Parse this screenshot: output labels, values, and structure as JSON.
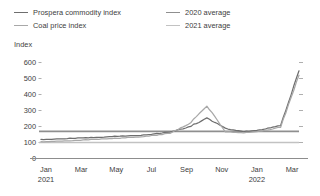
{
  "legend": {
    "items": [
      {
        "label": "Prospera commodity index",
        "color": "#6e6e6e",
        "name": "legend-prospera-commodity-index"
      },
      {
        "label": "Coal price index",
        "color": "#a8a8a8",
        "name": "legend-coal-price-index"
      },
      {
        "label": "2020 average",
        "color": "#8f8f8f",
        "name": "legend-2020-average"
      },
      {
        "label": "2021 average",
        "color": "#c2c2c2",
        "name": "legend-2021-average"
      }
    ]
  },
  "axis": {
    "y_title": "Index",
    "y_ticks": [
      "600",
      "500",
      "400",
      "300",
      "200",
      "100",
      "0"
    ],
    "x_ticks": [
      {
        "month": "Jan",
        "year": "2021"
      },
      {
        "month": "Mar",
        "year": ""
      },
      {
        "month": "May",
        "year": ""
      },
      {
        "month": "Jul",
        "year": ""
      },
      {
        "month": "Sep",
        "year": ""
      },
      {
        "month": "Nov",
        "year": ""
      },
      {
        "month": "Jan",
        "year": "2022"
      },
      {
        "month": "Mar",
        "year": ""
      }
    ]
  },
  "chart_data": {
    "type": "line",
    "title": "",
    "xlabel": "",
    "ylabel": "Index",
    "ylim": [
      0,
      600
    ],
    "ytick_values": [
      0,
      100,
      200,
      300,
      400,
      500,
      600
    ],
    "grid": false,
    "legend_position": "top",
    "x": [
      "2021-01",
      "2021-02",
      "2021-03",
      "2021-04",
      "2021-05",
      "2021-06",
      "2021-07",
      "2021-08",
      "2021-09",
      "2021-10",
      "2021-11",
      "2021-12",
      "2022-01",
      "2022-02",
      "2022-03"
    ],
    "series": [
      {
        "name": "Prospera commodity index",
        "color": "#6e6e6e",
        "values": [
          118,
          122,
          128,
          132,
          138,
          142,
          152,
          165,
          196,
          252,
          188,
          168,
          180,
          205,
          548
        ]
      },
      {
        "name": "Coal price index",
        "color": "#a8a8a8",
        "values": [
          104,
          108,
          114,
          120,
          126,
          132,
          142,
          158,
          212,
          330,
          168,
          160,
          172,
          196,
          520
        ]
      }
    ],
    "reference_lines": [
      {
        "name": "2020 average",
        "value": 170,
        "color": "#8f8f8f"
      },
      {
        "name": "2021 average",
        "value": 100,
        "color": "#c2c2c2"
      }
    ]
  }
}
